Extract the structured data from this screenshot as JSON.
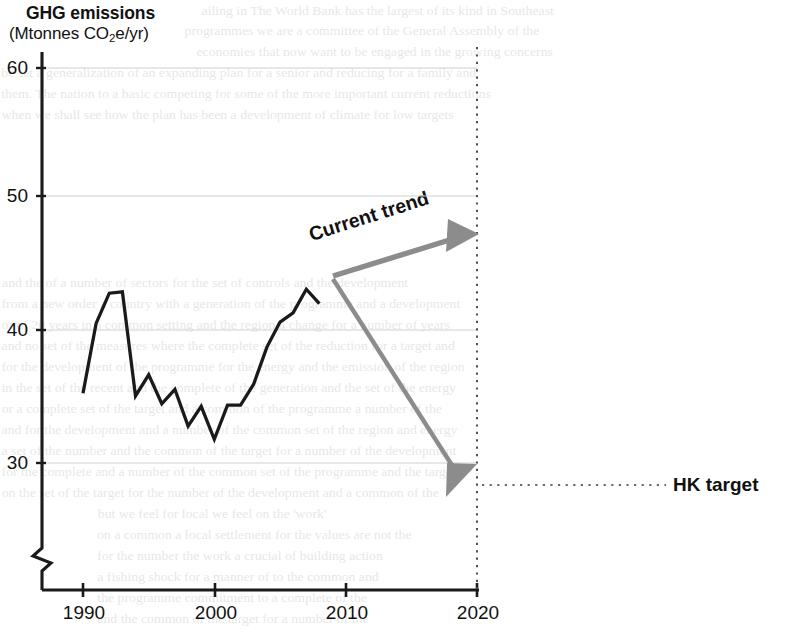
{
  "figure": {
    "title": "GHG emissions",
    "subtitle_prefix": "(Mtonnes CO",
    "subtitle_sub": "2",
    "subtitle_suffix": "e/yr)",
    "subtitle_plain": "(Mtonnes CO2e/yr)"
  },
  "annotations": {
    "trend_label": "Current trend",
    "target_label": "HK target"
  },
  "axes": {
    "y_ticks": [
      "60",
      "50",
      "40",
      "30"
    ],
    "x_ticks": [
      "1990",
      "2000",
      "2010",
      "2020"
    ],
    "y_axis_break": true
  },
  "colors": {
    "series_line": "#1a1a1a",
    "arrow_gray": "#8c8c8c",
    "gridline": "#cfcfcf",
    "axis": "#1a1a1a",
    "text": "#111111",
    "dotted_guide": "#555555"
  },
  "chart_data": {
    "type": "line",
    "title": "GHG emissions",
    "xlabel": "",
    "ylabel": "Mtonnes CO2e/yr",
    "xlim": [
      1988,
      2021
    ],
    "ylim": [
      28,
      61
    ],
    "y_ticks": [
      30,
      40,
      50,
      60
    ],
    "x_ticks": [
      1990,
      2000,
      2010,
      2020
    ],
    "grid": "horizontal",
    "y_axis_break_below": 29,
    "legend": "none",
    "series": [
      {
        "name": "Historical GHG emissions",
        "color": "#1a1a1a",
        "x": [
          1990,
          1991,
          1992,
          1993,
          1994,
          1995,
          1996,
          1997,
          1998,
          1999,
          2000,
          2001,
          2002,
          2003,
          2004,
          2005,
          2006,
          2007,
          2008
        ],
        "values": [
          35.3,
          40.6,
          42.9,
          43.0,
          35.1,
          36.7,
          34.5,
          35.6,
          32.8,
          34.3,
          31.8,
          34.4,
          34.4,
          36.0,
          38.8,
          40.7,
          41.4,
          43.2,
          42.1
        ]
      }
    ],
    "annotations": [
      {
        "label": "Current trend",
        "type": "arrow",
        "color": "#8c8c8c",
        "from": [
          2007.0,
          41.0
        ],
        "to": [
          2017.4,
          44.4
        ]
      },
      {
        "label": "",
        "type": "arrow",
        "color": "#8c8c8c",
        "from": [
          2007.0,
          40.8
        ],
        "to": [
          2017.4,
          28.2
        ]
      },
      {
        "label": "HK target",
        "type": "dotted-guide",
        "value": 28.3,
        "at_year": 2020
      },
      {
        "label": "",
        "type": "dotted-vertical",
        "at_year": 2020
      }
    ]
  },
  "background_text": {
    "note": "faint bleed-through from reverse side of scanned page",
    "lines": [
      {
        "x": 205,
        "y": 0,
        "text": "ailing in  The World Bank has the largest of its kind in Southeast"
      },
      {
        "x": 188,
        "y": 20,
        "text": "programmes we are a committee of the General Assembly of the"
      },
      {
        "x": 200,
        "y": 41,
        "text": "economies that now want to be engaged in the growing concerns"
      },
      {
        "x": 6,
        "y": 62,
        "text": "be set a generalization of an expanding plan for a senior and reducing for a family and"
      },
      {
        "x": 6,
        "y": 83,
        "text": "them. The nation to a basic competing for some of the more important current reductions"
      },
      {
        "x": 6,
        "y": 104,
        "text": "when we shall see how the plan has been a development of climate for low targets"
      },
      {
        "x": 6,
        "y": 272,
        "text": "and the of a number of sectors for the set of controls and the development"
      },
      {
        "x": 6,
        "y": 293,
        "text": "from a new order a country with a generation of the programme and a development"
      },
      {
        "x": 6,
        "y": 314,
        "text": "or of 20 years in a common setting and the regional change for a number of years"
      },
      {
        "x": 6,
        "y": 335,
        "text": "and no set of the measures where the complete set of the reduction for a target and"
      },
      {
        "x": 6,
        "y": 356,
        "text": "for the development of the programme for the energy and the emission of the region"
      },
      {
        "x": 6,
        "y": 377,
        "text": "in the set of the recent and the complete of the generation and the set of the energy"
      },
      {
        "x": 6,
        "y": 398,
        "text": "or a complete set of the target and a common of the programme a number of the"
      },
      {
        "x": 6,
        "y": 419,
        "text": "and for the development and a number of the common set of the region and energy"
      },
      {
        "x": 6,
        "y": 440,
        "text": "a set of the number and the common of the target for a number of the development"
      },
      {
        "x": 6,
        "y": 461,
        "text": "for the complete and a number of the common set of the programme and the target"
      },
      {
        "x": 6,
        "y": 482,
        "text": "on the set of the target for the number of the development and a common of the"
      },
      {
        "x": 100,
        "y": 503,
        "text": "but we feel for local we feel on the 'work'"
      },
      {
        "x": 100,
        "y": 524,
        "text": "on a common a local settlement for the values are not the"
      },
      {
        "x": 100,
        "y": 545,
        "text": "for the number the work a crucial of building action"
      },
      {
        "x": 100,
        "y": 566,
        "text": "a fishing shock for a manner of to the common and"
      },
      {
        "x": 100,
        "y": 587,
        "text": "the programme commitment to a complete of the"
      },
      {
        "x": 100,
        "y": 608,
        "text": "and the common of the target for a number of the"
      }
    ]
  }
}
